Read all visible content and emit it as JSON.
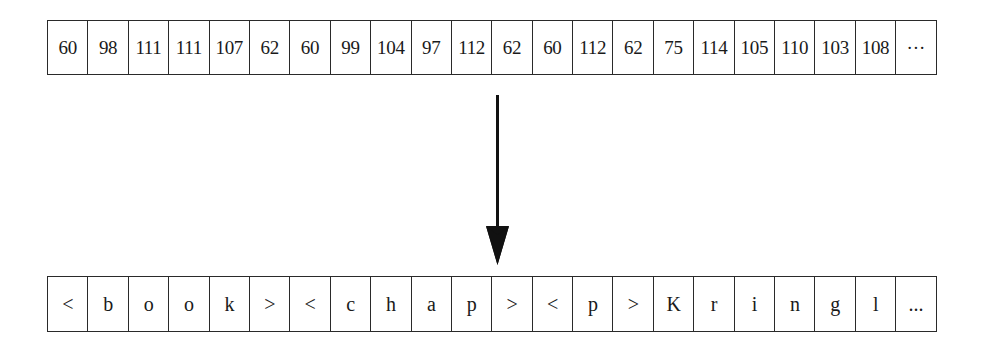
{
  "diagram": {
    "top_row": {
      "label": "byte values",
      "cells": [
        "60",
        "98",
        "111",
        "111",
        "107",
        "62",
        "60",
        "99",
        "104",
        "97",
        "112",
        "62",
        "60",
        "112",
        "62",
        "75",
        "114",
        "105",
        "110",
        "103",
        "108",
        "···"
      ]
    },
    "arrow": {
      "direction": "down",
      "icon": "arrow-down-icon"
    },
    "bottom_row": {
      "label": "decoded characters",
      "cells": [
        "<",
        "b",
        "o",
        "o",
        "k",
        ">",
        "<",
        "c",
        "h",
        "a",
        "p",
        ">",
        "<",
        "p",
        ">",
        "K",
        "r",
        "i",
        "n",
        "g",
        "l",
        "..."
      ]
    },
    "colors": {
      "stroke": "#2a2a2a",
      "text": "#1a1a1a",
      "background": "#ffffff"
    }
  }
}
